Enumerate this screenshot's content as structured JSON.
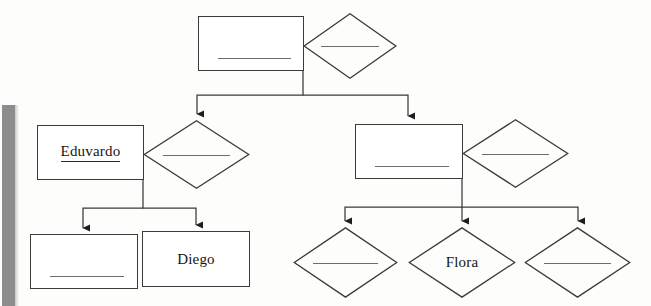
{
  "diagram": {
    "type": "family-tree-flowchart",
    "title": "",
    "style": {
      "stroke_color": "#3a3a3a",
      "rule_color": "#6d6d6d",
      "text_color": "#151515",
      "background_color": "#fdfdfc",
      "scan_band_color": "#8d8d8d"
    },
    "nodes": [
      {
        "id": "n1",
        "shape": "rectangle",
        "label": "",
        "blank": true,
        "underlined": false,
        "x": 198,
        "y": 16,
        "w": 106,
        "h": 55
      },
      {
        "id": "n2",
        "shape": "diamond",
        "label": "",
        "blank": true,
        "underlined": false,
        "x": 303,
        "y": 13,
        "w": 94,
        "h": 66
      },
      {
        "id": "n3",
        "shape": "rectangle",
        "label": "Eduvardo",
        "blank": false,
        "underlined": true,
        "x": 37,
        "y": 125,
        "w": 107,
        "h": 55
      },
      {
        "id": "n4",
        "shape": "diamond",
        "label": "",
        "blank": true,
        "underlined": false,
        "x": 143,
        "y": 120,
        "w": 107,
        "h": 69
      },
      {
        "id": "n5",
        "shape": "rectangle",
        "label": "",
        "blank": true,
        "underlined": false,
        "x": 355,
        "y": 124,
        "w": 108,
        "h": 55
      },
      {
        "id": "n6",
        "shape": "diamond",
        "label": "",
        "blank": true,
        "underlined": false,
        "x": 462,
        "y": 119,
        "w": 107,
        "h": 69
      },
      {
        "id": "n7",
        "shape": "rectangle",
        "label": "",
        "blank": true,
        "underlined": false,
        "x": 30,
        "y": 234,
        "w": 108,
        "h": 55
      },
      {
        "id": "n8",
        "shape": "rectangle",
        "label": "Diego",
        "blank": false,
        "underlined": false,
        "x": 142,
        "y": 231,
        "w": 108,
        "h": 56
      },
      {
        "id": "n9",
        "shape": "diamond",
        "label": "",
        "blank": true,
        "underlined": false,
        "x": 293,
        "y": 227,
        "w": 105,
        "h": 71
      },
      {
        "id": "n10",
        "shape": "diamond",
        "label": "Flora",
        "blank": false,
        "underlined": false,
        "x": 408,
        "y": 227,
        "w": 108,
        "h": 71
      },
      {
        "id": "n11",
        "shape": "diamond",
        "label": "",
        "blank": true,
        "underlined": false,
        "x": 524,
        "y": 227,
        "w": 107,
        "h": 71
      }
    ],
    "connectors": [
      {
        "id": "c1",
        "from": "n1",
        "to": "n4",
        "arrow": true
      },
      {
        "id": "c2",
        "from": "n1",
        "to": "n5",
        "arrow": true
      },
      {
        "id": "c3",
        "from": "n3",
        "to": "n7",
        "arrow": true
      },
      {
        "id": "c4",
        "from": "n3",
        "to": "n8",
        "arrow": true
      },
      {
        "id": "c5",
        "from": "n5",
        "to": "n9",
        "arrow": true
      },
      {
        "id": "c6",
        "from": "n5",
        "to": "n10",
        "arrow": true
      },
      {
        "id": "c7",
        "from": "n5",
        "to": "n11",
        "arrow": true
      }
    ]
  }
}
